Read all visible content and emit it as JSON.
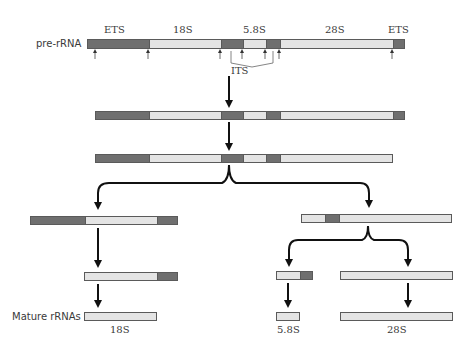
{
  "labels": {
    "pre_rrna": "pre-rRNA",
    "mature_rrnas": "Mature rRNAs",
    "top": {
      "ets_left": "ETS",
      "s18": "18S",
      "s58": "5.8S",
      "s28": "28S",
      "ets_right": "ETS",
      "its": "ITS"
    },
    "products": {
      "s18": "18S",
      "s58": "5.8S",
      "s28": "28S"
    }
  },
  "colors": {
    "spacer": "#6f6f6f",
    "mature": "#e4e4e4",
    "outline": "#5a5a5a",
    "arrow": "#111111"
  },
  "legend_semantics": {
    "dark_segments": "spacer regions (ETS / ITS)",
    "light_segments": "mature rRNA sequences (18S, 5.8S, 28S)"
  }
}
